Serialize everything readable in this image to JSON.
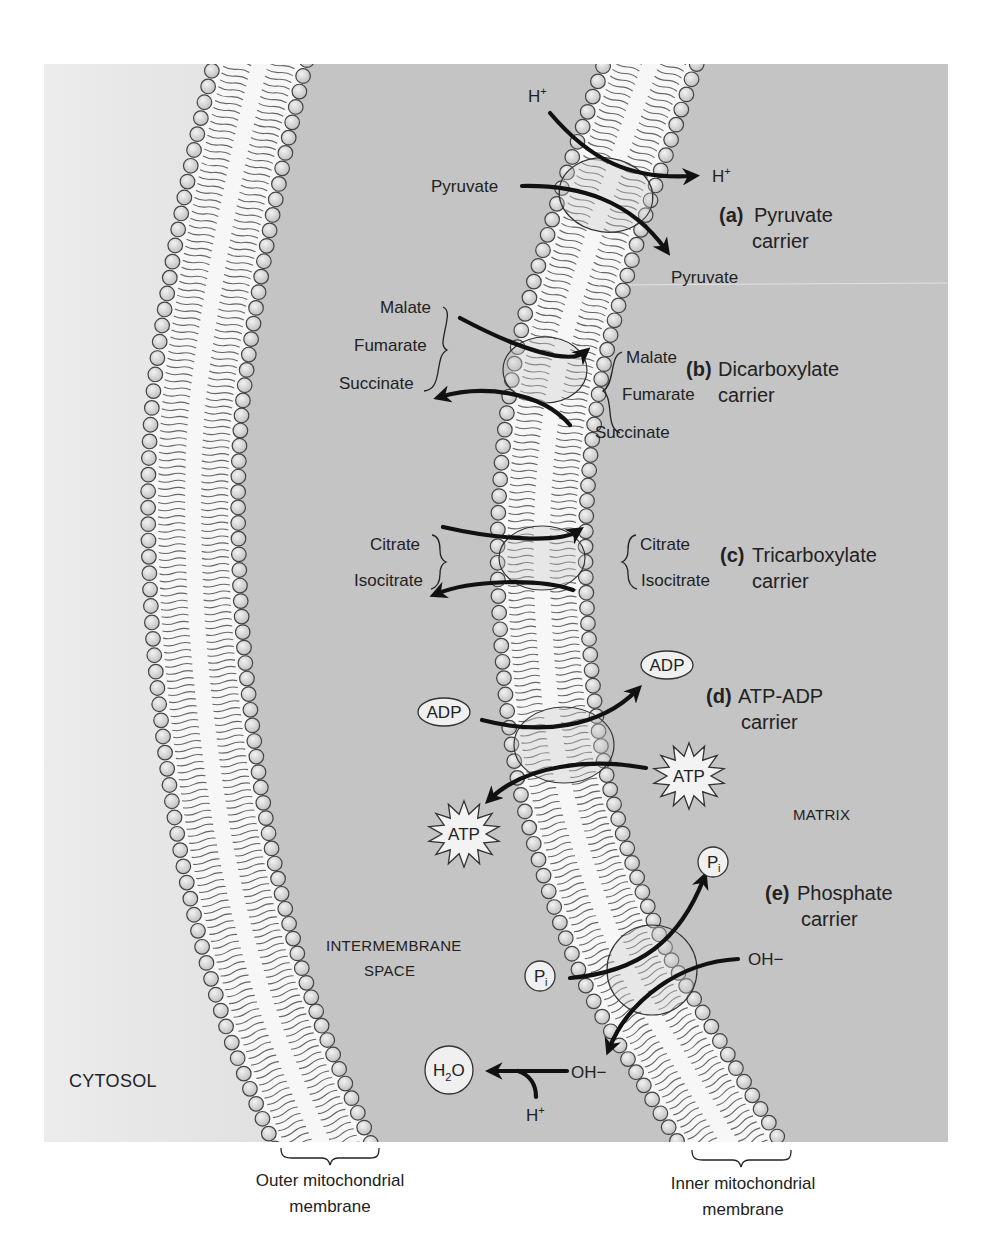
{
  "regions": {
    "cytosol": "CYTOSOL",
    "intermembrane_line1": "INTERMEMBRANE",
    "intermembrane_line2": "SPACE",
    "matrix": "MATRIX"
  },
  "membranes": {
    "outer_line1": "Outer mitochondrial",
    "outer_line2": "membrane",
    "inner_line1": "Inner mitochondrial",
    "inner_line2": "membrane"
  },
  "carriers": [
    {
      "letter": "(a)",
      "name_line1": "Pyruvate",
      "name_line2": "carrier",
      "left_molecules": [
        "H+",
        "Pyruvate"
      ],
      "right_molecules": [
        "H+",
        "Pyruvate"
      ]
    },
    {
      "letter": "(b)",
      "name_line1": "Dicarboxylate",
      "name_line2": "carrier",
      "left_molecules": [
        "Malate",
        "Fumarate",
        "Succinate"
      ],
      "right_molecules": [
        "Malate",
        "Fumarate",
        "Succinate"
      ]
    },
    {
      "letter": "(c)",
      "name_line1": "Tricarboxylate",
      "name_line2": "carrier",
      "left_molecules": [
        "Citrate",
        "Isocitrate"
      ],
      "right_molecules": [
        "Citrate",
        "Isocitrate"
      ]
    },
    {
      "letter": "(d)",
      "name_line1": "ATP-ADP",
      "name_line2": "carrier",
      "left_molecules": [
        "ADP",
        "ATP"
      ],
      "right_molecules": [
        "ADP",
        "ATP"
      ]
    },
    {
      "letter": "(e)",
      "name_line1": "Phosphate",
      "name_line2": "carrier",
      "left_molecules": [
        "P",
        "i",
        "OH−"
      ],
      "right_molecules": [
        "P",
        "i",
        "OH−"
      ]
    }
  ],
  "water_reaction": {
    "product_main": "H",
    "product_sub": "2",
    "product_tail": "O",
    "proton": "H",
    "proton_sup": "+",
    "hydroxide": "OH−"
  },
  "symbols": {
    "H": "H",
    "plus": "+"
  },
  "colors": {
    "cytosol": "#e9e9e9",
    "spaces": "#c4c4c4",
    "membrane_core": "#f7f7f7",
    "head_fill": "#d9d9d9",
    "head_stroke": "#444444",
    "tail": "#666666"
  }
}
